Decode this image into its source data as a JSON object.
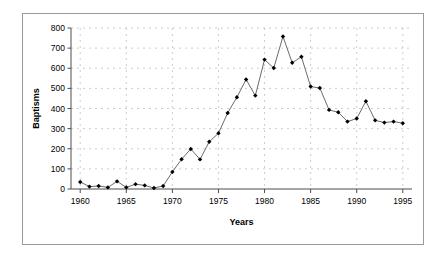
{
  "chart_data": {
    "type": "line",
    "title": "",
    "xlabel": "Years",
    "ylabel": "Baptisms",
    "xlim": [
      1959,
      1996
    ],
    "ylim": [
      0,
      800
    ],
    "xticks": [
      1960,
      1965,
      1970,
      1975,
      1980,
      1985,
      1990,
      1995
    ],
    "yticks": [
      0,
      100,
      200,
      300,
      400,
      500,
      600,
      700,
      800
    ],
    "grid": "horizontal-and-vertical-dashed",
    "legend": "none",
    "marker": "filled-diamond",
    "line_color": "#595959",
    "marker_color": "#000000",
    "x": [
      1960,
      1961,
      1962,
      1963,
      1964,
      1965,
      1966,
      1967,
      1968,
      1969,
      1970,
      1971,
      1972,
      1973,
      1974,
      1975,
      1976,
      1977,
      1978,
      1979,
      1980,
      1981,
      1982,
      1983,
      1984,
      1985,
      1986,
      1987,
      1988,
      1989,
      1990,
      1991,
      1992,
      1993,
      1994,
      1995
    ],
    "values": [
      35,
      12,
      15,
      8,
      38,
      8,
      24,
      18,
      5,
      15,
      85,
      148,
      199,
      147,
      235,
      277,
      378,
      456,
      544,
      464,
      643,
      601,
      758,
      627,
      657,
      509,
      502,
      393,
      381,
      335,
      350,
      436,
      341,
      330,
      335,
      327
    ],
    "series": [
      {
        "name": "Baptisms",
        "values": [
          35,
          12,
          15,
          8,
          38,
          8,
          24,
          18,
          5,
          15,
          85,
          148,
          199,
          147,
          235,
          277,
          378,
          456,
          544,
          464,
          643,
          601,
          758,
          627,
          657,
          509,
          502,
          393,
          381,
          335,
          350,
          436,
          341,
          330,
          335,
          327
        ]
      }
    ]
  }
}
